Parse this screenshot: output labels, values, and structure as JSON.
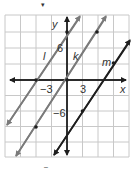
{
  "diagram": {
    "type": "coordinate-plane-parallel-lines",
    "axes": {
      "x_label": "x",
      "y_label": "y",
      "tick_labels": {
        "x_neg": "−3",
        "x_pos": "3",
        "y_pos": "6",
        "y_neg": "−6"
      },
      "grid_unit": 3,
      "x_range": [
        -12,
        12
      ],
      "y_range": [
        -15,
        12
      ]
    },
    "lines": [
      {
        "name": "l",
        "label": "l",
        "slope": 1.5,
        "points": [
          [
            -6,
            0
          ],
          [
            0,
            9
          ]
        ],
        "color": "#7a7a7a"
      },
      {
        "name": "k",
        "label": "k",
        "slope": 1.5,
        "points": [
          [
            -6,
            -9
          ],
          [
            0,
            0
          ],
          [
            6,
            9
          ]
        ],
        "color": "#7a7a7a"
      },
      {
        "name": "m",
        "label": "m",
        "slope": 1.5,
        "points": [
          [
            3,
            -6
          ],
          [
            9,
            3
          ]
        ],
        "color": "#1e1e1e"
      }
    ],
    "colors": {
      "grid": "#c8c8c8",
      "axis": "#1e1e1e",
      "gray_line": "#7a7a7a",
      "dark_line": "#1e1e1e"
    },
    "top_mark": "▾",
    "bottom_mark": "–"
  }
}
